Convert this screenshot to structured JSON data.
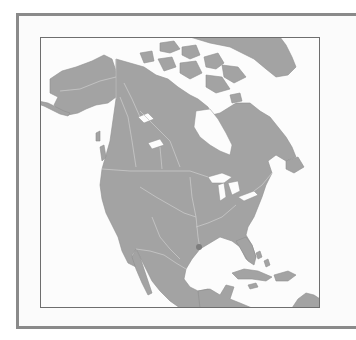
{
  "map": {
    "region": "North America",
    "style": "grayscale outline map",
    "colors": {
      "land": "#a3a3a3",
      "water": "#fcfcfc",
      "borders": "#c9c9c9",
      "frame": "#8a8a8a",
      "marker": "#7d7d7d"
    },
    "marker": {
      "label": "",
      "cx": 159,
      "cy": 210
    }
  }
}
